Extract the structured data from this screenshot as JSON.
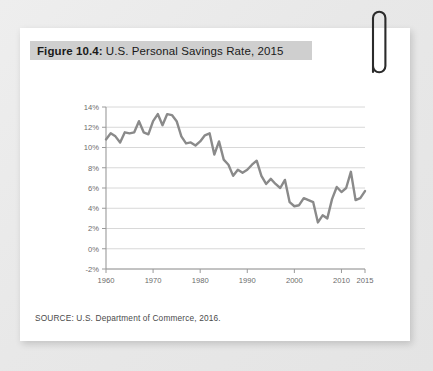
{
  "figure": {
    "label": "Figure 10.4:",
    "caption": "U.S. Personal Savings Rate, 2015",
    "source": "SOURCE: U.S. Department of Commerce, 2016."
  },
  "decoration": {
    "paperclip_name": "paperclip-icon"
  },
  "colors": {
    "card_background": "#ffffff",
    "page_background": "#e9e9e9",
    "title_highlight": "#cfcfcf",
    "line": "#8a8a8a",
    "grid": "#d8d8d8",
    "axis": "#9a9a9a",
    "tick_text": "#6b6b6b"
  },
  "chart_data": {
    "type": "line",
    "title": "U.S. Personal Savings Rate, 2015",
    "xlabel": "",
    "ylabel": "",
    "xlim": [
      1960,
      2015
    ],
    "ylim": [
      -2,
      14
    ],
    "ytick_labels": [
      "14%",
      "12%",
      "10%",
      "8%",
      "6%",
      "4%",
      "2%",
      "0%",
      "-2%"
    ],
    "ytick_values": [
      14,
      12,
      10,
      8,
      6,
      4,
      2,
      0,
      -2
    ],
    "xtick_labels": [
      "1960",
      "1970",
      "1980",
      "1990",
      "2000",
      "2010",
      "2015"
    ],
    "xtick_values": [
      1960,
      1970,
      1980,
      1990,
      2000,
      2010,
      2015
    ],
    "grid": true,
    "legend": false,
    "series": [
      {
        "name": "Personal Savings Rate",
        "x": [
          1960,
          1961,
          1962,
          1963,
          1964,
          1965,
          1966,
          1967,
          1968,
          1969,
          1970,
          1971,
          1972,
          1973,
          1974,
          1975,
          1976,
          1977,
          1978,
          1979,
          1980,
          1981,
          1982,
          1983,
          1984,
          1985,
          1986,
          1987,
          1988,
          1989,
          1990,
          1991,
          1992,
          1993,
          1994,
          1995,
          1996,
          1997,
          1998,
          1999,
          2000,
          2001,
          2002,
          2003,
          2004,
          2005,
          2006,
          2007,
          2008,
          2009,
          2010,
          2011,
          2012,
          2013,
          2014,
          2015
        ],
        "values": [
          10.8,
          11.4,
          11.1,
          10.5,
          11.5,
          11.4,
          11.5,
          12.6,
          11.5,
          11.3,
          12.6,
          13.3,
          12.2,
          13.3,
          13.2,
          12.6,
          11.1,
          10.4,
          10.5,
          10.2,
          10.6,
          11.2,
          11.4,
          9.3,
          10.6,
          8.8,
          8.3,
          7.2,
          7.8,
          7.5,
          7.8,
          8.3,
          8.7,
          7.2,
          6.4,
          6.9,
          6.4,
          6.0,
          6.8,
          4.6,
          4.2,
          4.3,
          5.0,
          4.8,
          4.6,
          2.6,
          3.3,
          3.0,
          4.9,
          6.1,
          5.6,
          6.0,
          7.6,
          4.8,
          5.0,
          5.7
        ]
      }
    ]
  }
}
